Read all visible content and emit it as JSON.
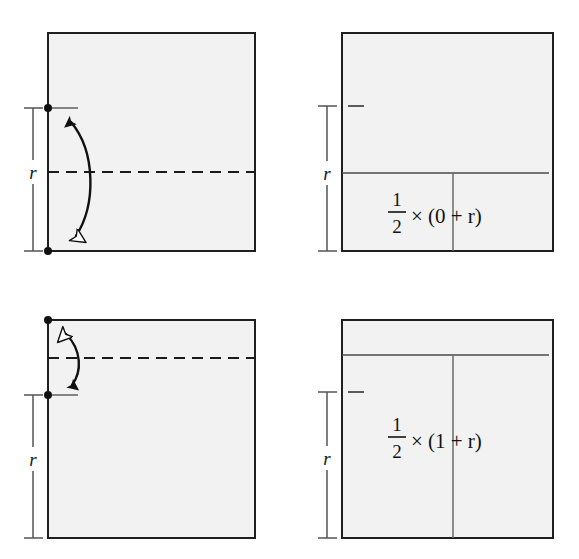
{
  "figure": {
    "background_color": "#ffffff",
    "panel_fill": "#f2f2f2",
    "panel_stroke": "#1f1f1f",
    "line_color": "#4a4a4a",
    "dash_color": "#1a1a1a",
    "arrow_color": "#111111",
    "text_color": "#121212"
  },
  "panels": [
    {
      "id": "top-left",
      "name": "panel-top-left",
      "measure_label": "r",
      "has_dashed_line": true,
      "has_curved_arrow": true,
      "arrow_head_top": "solid",
      "arrow_head_bottom": "hollow",
      "endpoint_dots": 2,
      "formula": null
    },
    {
      "id": "top-right",
      "name": "panel-top-right",
      "measure_label": "r",
      "has_dashed_line": false,
      "has_curved_arrow": false,
      "endpoint_dots": 0,
      "formula": {
        "numerator": "1",
        "denominator": "2",
        "operator": "×",
        "expression": "(0 + r)",
        "full_text": "½ × (0 + r)"
      },
      "tick_dash_inside": true,
      "horizontal_rule": true,
      "vertical_rule": true
    },
    {
      "id": "bottom-left",
      "name": "panel-bottom-left",
      "measure_label": "r",
      "has_dashed_line": true,
      "has_curved_arrow": true,
      "arrow_head_top": "hollow",
      "arrow_head_bottom": "solid",
      "endpoint_dots": 2,
      "formula": null
    },
    {
      "id": "bottom-right",
      "name": "panel-bottom-right",
      "measure_label": "r",
      "has_dashed_line": false,
      "has_curved_arrow": false,
      "endpoint_dots": 0,
      "formula": {
        "numerator": "1",
        "denominator": "2",
        "operator": "×",
        "expression": "(1 + r)",
        "full_text": "½ × (1 + r)"
      },
      "tick_dash_inside": true,
      "horizontal_rule": true,
      "vertical_rule": true
    }
  ],
  "labels": {
    "r_top_left": "r",
    "r_top_right": "r",
    "r_bottom_left": "r",
    "r_bottom_right": "r",
    "frac_num_tr": "1",
    "frac_den_tr": "2",
    "times_tr": "×",
    "expr_tr": "(0 + r)",
    "frac_num_br": "1",
    "frac_den_br": "2",
    "times_br": "×",
    "expr_br": "(1 + r)"
  }
}
